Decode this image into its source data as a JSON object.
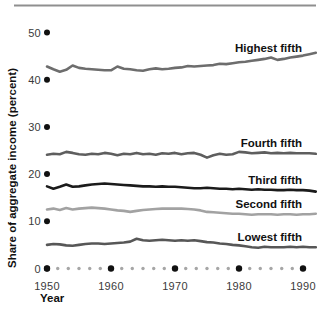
{
  "figure": {
    "top_rule_color": "#8f8f8f",
    "background": "#ffffff"
  },
  "chart_data": {
    "type": "line",
    "title": "",
    "xlabel": "Year",
    "ylabel": "Share of aggregate income (percent)",
    "xlim": [
      1950,
      1992
    ],
    "ylim": [
      0,
      50
    ],
    "x_ticks": [
      1950,
      1960,
      1970,
      1980,
      1990
    ],
    "y_ticks": [
      0,
      10,
      20,
      30,
      40,
      50
    ],
    "grid": false,
    "legend_position": "inline-right-of-lines",
    "axis_style": "dotted-baseline-with-big-tick-dots",
    "minor_dots_per_gap": 5,
    "axis_dot_color": "#111111",
    "minor_dot_color": "#a6a6a6",
    "tick_label_color": "#3a3a3a",
    "label_color": "#111111",
    "x_start": 1950,
    "series": [
      {
        "name": "Highest fifth",
        "color": "#6d6d6d",
        "values": [
          42.8,
          42.2,
          41.7,
          42.1,
          43.0,
          42.5,
          42.3,
          42.2,
          42.1,
          42.0,
          42.0,
          42.8,
          42.3,
          42.2,
          42.0,
          41.9,
          42.2,
          42.4,
          42.2,
          42.3,
          42.5,
          42.6,
          42.9,
          42.8,
          42.9,
          43.0,
          43.1,
          43.4,
          43.3,
          43.5,
          43.7,
          43.8,
          44.0,
          44.2,
          44.4,
          44.7,
          44.2,
          44.4,
          44.7,
          44.9,
          45.1,
          45.4,
          45.7
        ]
      },
      {
        "name": "Fourth fifth",
        "color": "#5e5e5e",
        "values": [
          24.1,
          24.3,
          24.2,
          24.7,
          24.5,
          24.2,
          24.1,
          24.3,
          24.2,
          24.5,
          24.3,
          24.0,
          24.3,
          24.2,
          24.5,
          24.2,
          24.3,
          24.1,
          24.4,
          24.3,
          24.5,
          24.2,
          24.4,
          24.5,
          24.1,
          23.5,
          24.0,
          24.3,
          24.1,
          24.2,
          24.7,
          24.6,
          24.4,
          24.5,
          24.6,
          24.4,
          24.5,
          24.4,
          24.5,
          24.4,
          24.4,
          24.4,
          24.3
        ]
      },
      {
        "name": "Third fifth",
        "color": "#1b1b1b",
        "values": [
          17.4,
          16.9,
          17.3,
          17.8,
          17.3,
          17.4,
          17.6,
          17.8,
          17.9,
          18.0,
          17.9,
          17.8,
          17.7,
          17.6,
          17.5,
          17.4,
          17.4,
          17.3,
          17.4,
          17.3,
          17.3,
          17.2,
          17.1,
          17.0,
          17.0,
          17.1,
          17.0,
          16.9,
          16.9,
          16.8,
          16.9,
          16.8,
          16.7,
          16.8,
          16.7,
          16.7,
          16.6,
          16.6,
          16.7,
          16.6,
          16.6,
          16.5,
          16.3
        ]
      },
      {
        "name": "Second fifth",
        "color": "#a2a2a2",
        "values": [
          12.5,
          12.7,
          12.4,
          12.8,
          12.5,
          12.7,
          12.8,
          12.9,
          12.8,
          12.7,
          12.5,
          12.3,
          12.2,
          12.0,
          12.2,
          12.4,
          12.5,
          12.6,
          12.7,
          12.7,
          12.7,
          12.7,
          12.6,
          12.5,
          12.3,
          12.0,
          11.9,
          11.8,
          11.7,
          11.6,
          11.6,
          11.5,
          11.4,
          11.5,
          11.5,
          11.5,
          11.4,
          11.5,
          11.5,
          11.4,
          11.5,
          11.5,
          11.6
        ]
      },
      {
        "name": "Lowest fifth",
        "color": "#575757",
        "values": [
          5.0,
          5.2,
          5.1,
          4.9,
          4.8,
          5.0,
          5.2,
          5.3,
          5.3,
          5.2,
          5.3,
          5.4,
          5.5,
          5.7,
          6.3,
          6.0,
          5.9,
          6.0,
          6.1,
          6.0,
          5.9,
          6.0,
          5.9,
          6.0,
          5.8,
          5.6,
          5.5,
          5.3,
          5.2,
          5.0,
          4.9,
          4.7,
          4.5,
          4.4,
          4.6,
          4.5,
          4.5,
          4.5,
          4.6,
          4.5,
          4.6,
          4.5,
          4.5
        ]
      }
    ]
  }
}
